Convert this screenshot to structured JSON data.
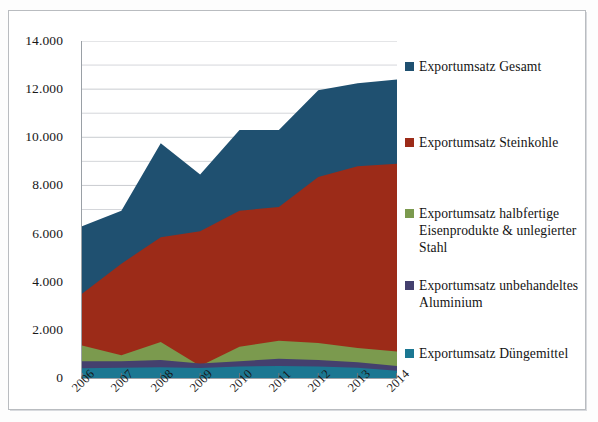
{
  "chart_data": {
    "type": "area",
    "title": "",
    "subtitle": "",
    "xlabel": "",
    "ylabel": "",
    "categories": [
      "2006",
      "2007",
      "2008",
      "2009",
      "2010",
      "2011",
      "2012",
      "2013",
      "2014"
    ],
    "ylim": [
      0,
      14000
    ],
    "ytick_labels": [
      "0",
      "2.000",
      "4.000",
      "6.000",
      "8.000",
      "10.000",
      "12.000",
      "14.000"
    ],
    "ytick_values": [
      0,
      2000,
      4000,
      6000,
      8000,
      10000,
      12000,
      14000
    ],
    "minor_gridline_step": 1000,
    "grid": true,
    "legend_position": "right",
    "stacking": "overlaid",
    "series": [
      {
        "name": "Exportumsatz Gesamt",
        "color": "#1f5070",
        "values": [
          6300,
          6950,
          9750,
          8450,
          10300,
          10300,
          11950,
          12250,
          12400
        ]
      },
      {
        "name": "Exportumsatz Steinkohle",
        "color": "#9c2b18",
        "values": [
          3500,
          4750,
          5850,
          6100,
          6950,
          7100,
          8350,
          8800,
          8900
        ]
      },
      {
        "name": "Exportumsatz halbfertige Eisenprodukte & unlegierter Stahl",
        "color": "#7b9a4e",
        "values": [
          1350,
          950,
          1500,
          500,
          1300,
          1550,
          1450,
          1250,
          1100
        ]
      },
      {
        "name": "Exportumsatz unbehandeltes Aluminium",
        "color": "#44406e",
        "values": [
          700,
          700,
          750,
          600,
          700,
          800,
          750,
          650,
          500
        ]
      },
      {
        "name": "Exportumsatz Düngemittel",
        "color": "#1b7792",
        "values": [
          400,
          430,
          450,
          420,
          480,
          500,
          480,
          430,
          300
        ]
      }
    ]
  },
  "legend": {
    "items": [
      {
        "label": "Exportumsatz Gesamt",
        "color": "#1f5070",
        "top": 9
      },
      {
        "label": "Exportumsatz Steinkohle",
        "color": "#9c2b18",
        "top": 85
      },
      {
        "label": "Exportumsatz halbfertige Eisenprodukte & unlegierter Stahl",
        "color": "#7b9a4e",
        "top": 156
      },
      {
        "label": "Exportumsatz unbehandeltes Aluminium",
        "color": "#44406e",
        "top": 228
      },
      {
        "label": "Exportumsatz Düngemittel",
        "color": "#1b7792",
        "top": 296
      }
    ]
  },
  "axis": {
    "y_labels": [
      "14.000",
      "12.000",
      "10.000",
      "8.000",
      "6.000",
      "4.000",
      "2.000",
      "0"
    ],
    "x_labels": [
      "2006",
      "2007",
      "2008",
      "2009",
      "2010",
      "2011",
      "2012",
      "2013",
      "2014"
    ]
  },
  "colors": {
    "grid": "#c9ccd0",
    "axis": "#9aa0a6",
    "frame": "#b9bcc0",
    "text": "#141414",
    "background": "#ffffff"
  }
}
